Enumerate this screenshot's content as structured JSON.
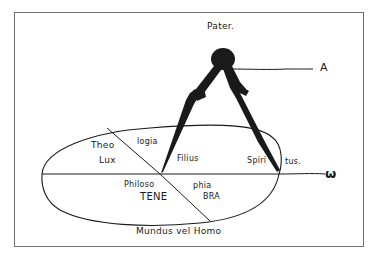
{
  "diagram": {
    "top_label": "Pater.",
    "right_top_label": "A",
    "right_axis_label": "ω",
    "bottom_label": "Mundus vel Homo",
    "regions": {
      "upper_left_1": "Theo",
      "upper_left_2": "Lux",
      "upper_middle": "logia",
      "center": "Filius",
      "right_1": "Spiri",
      "right_2": "tus.",
      "lower_left_1": "Philoso",
      "lower_left_2": "TENE",
      "lower_right_1": "phia",
      "lower_right_2": "BRA"
    },
    "figure": "compass",
    "colors": {
      "ink": "#1a1a1a",
      "frame": "#707070",
      "background": "#ffffff"
    }
  }
}
